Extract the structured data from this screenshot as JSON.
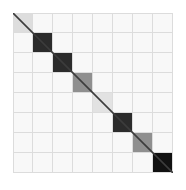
{
  "figure": {
    "background_color": "#ffffff",
    "plot_background_color": "#f8f8f8",
    "grid_line_color": "#dcdcdc",
    "diagonal_line_color": "#3c3c3c"
  },
  "chart_data": {
    "type": "heatmap",
    "title": "",
    "xlabel": "",
    "ylabel": "",
    "grid": true,
    "legend": "none",
    "rows": 8,
    "columns": 8,
    "x": [
      0,
      1,
      2,
      3,
      4,
      5,
      6,
      7
    ],
    "y": [
      0,
      1,
      2,
      3,
      4,
      5,
      6,
      7
    ],
    "xticklabels": [],
    "yticklabels": [],
    "annotations": [
      "diagonal reference line from top-left to bottom-right"
    ],
    "colorscale": "grayscale",
    "zlim": [
      0,
      1
    ],
    "values": [
      [
        0.15,
        0,
        0,
        0,
        0,
        0,
        0,
        0
      ],
      [
        0,
        0.88,
        0,
        0,
        0,
        0,
        0,
        0
      ],
      [
        0,
        0,
        0.88,
        0,
        0,
        0,
        0,
        0
      ],
      [
        0,
        0,
        0,
        0.55,
        0,
        0,
        0,
        0
      ],
      [
        0,
        0,
        0,
        0,
        0.12,
        0,
        0,
        0
      ],
      [
        0,
        0,
        0,
        0,
        0,
        0.88,
        0,
        0
      ],
      [
        0,
        0,
        0,
        0,
        0,
        0,
        0.55,
        0
      ],
      [
        0,
        0,
        0,
        0,
        0,
        0,
        0,
        0.88
      ]
    ],
    "cell_colors": [
      [
        "#dddddd",
        "#f8f8f8",
        "#f8f8f8",
        "#f8f8f8",
        "#f8f8f8",
        "#f8f8f8",
        "#f8f8f8",
        "#f8f8f8"
      ],
      [
        "#f8f8f8",
        "#2b2b2b",
        "#f8f8f8",
        "#f8f8f8",
        "#f8f8f8",
        "#f8f8f8",
        "#f8f8f8",
        "#f8f8f8"
      ],
      [
        "#f8f8f8",
        "#f8f8f8",
        "#2b2b2b",
        "#f8f8f8",
        "#f8f8f8",
        "#f8f8f8",
        "#f8f8f8",
        "#f8f8f8"
      ],
      [
        "#f8f8f8",
        "#f8f8f8",
        "#f8f8f8",
        "#8f8f8f",
        "#f8f8f8",
        "#f8f8f8",
        "#f8f8f8",
        "#f8f8f8"
      ],
      [
        "#f8f8f8",
        "#f8f8f8",
        "#f8f8f8",
        "#f8f8f8",
        "#e2e2e2",
        "#f8f8f8",
        "#f8f8f8",
        "#f8f8f8"
      ],
      [
        "#f8f8f8",
        "#f8f8f8",
        "#f8f8f8",
        "#f8f8f8",
        "#f8f8f8",
        "#2b2b2b",
        "#f8f8f8",
        "#f8f8f8"
      ],
      [
        "#f8f8f8",
        "#f8f8f8",
        "#f8f8f8",
        "#f8f8f8",
        "#f8f8f8",
        "#f8f8f8",
        "#8f8f8f",
        "#f8f8f8"
      ],
      [
        "#f8f8f8",
        "#f8f8f8",
        "#f8f8f8",
        "#f8f8f8",
        "#f8f8f8",
        "#f8f8f8",
        "#f8f8f8",
        "#111111"
      ]
    ]
  }
}
